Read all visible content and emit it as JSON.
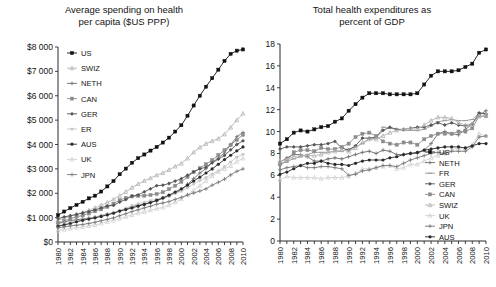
{
  "chart_data": [
    {
      "id": "left",
      "type": "line",
      "title": "Average spending on health per capita ($US PPP)",
      "title_lines": [
        "Average spending on health",
        "per capita ($US PPP)"
      ],
      "xlabel": "",
      "ylabel": "",
      "ylim": [
        0,
        8000
      ],
      "ytick_values": [
        0,
        1000,
        2000,
        3000,
        4000,
        5000,
        6000,
        7000,
        8000
      ],
      "ytick_labels": [
        "$0",
        "$1 000",
        "$2 000",
        "$3 000",
        "$4 000",
        "$5 000",
        "$6 000",
        "$7 000",
        "$8 000"
      ],
      "xlim": [
        1980,
        2010
      ],
      "xtick_values": [
        1980,
        1982,
        1984,
        1986,
        1988,
        1990,
        1992,
        1994,
        1996,
        1998,
        2000,
        2002,
        2004,
        2006,
        2008,
        2010
      ],
      "xtick_labels": [
        "1980",
        "1982",
        "1984",
        "1986",
        "1988",
        "1990",
        "1992",
        "1994",
        "1996",
        "1998",
        "2000",
        "2002",
        "2004",
        "2006",
        "2008",
        "2010"
      ],
      "x": [
        1980,
        1981,
        1982,
        1983,
        1984,
        1985,
        1986,
        1987,
        1988,
        1989,
        1990,
        1991,
        1992,
        1993,
        1994,
        1995,
        1996,
        1997,
        1998,
        1999,
        2000,
        2001,
        2002,
        2003,
        2004,
        2005,
        2006,
        2007,
        2008,
        2009,
        2010
      ],
      "grid": false,
      "legend_position": "upper-left",
      "series": [
        {
          "name": "US",
          "color": "#111111",
          "marker": "square",
          "values": [
            1100,
            1250,
            1390,
            1520,
            1650,
            1790,
            1900,
            2070,
            2280,
            2500,
            2780,
            3010,
            3250,
            3440,
            3590,
            3750,
            3900,
            4080,
            4280,
            4530,
            4790,
            5180,
            5600,
            6000,
            6370,
            6720,
            7070,
            7430,
            7720,
            7850,
            7900
          ]
        },
        {
          "name": "SWIZ",
          "color": "#b4b4b4",
          "marker": "triangle",
          "values": [
            900,
            980,
            1060,
            1140,
            1210,
            1300,
            1400,
            1510,
            1620,
            1750,
            1900,
            2060,
            2230,
            2380,
            2510,
            2620,
            2740,
            2830,
            2960,
            3100,
            3220,
            3430,
            3680,
            3880,
            4030,
            4140,
            4240,
            4420,
            4700,
            5000,
            5270
          ]
        },
        {
          "name": "NETH",
          "color": "#6e6e6e",
          "marker": "plus",
          "values": [
            760,
            820,
            880,
            910,
            940,
            980,
            1020,
            1080,
            1150,
            1200,
            1270,
            1350,
            1450,
            1510,
            1560,
            1620,
            1690,
            1790,
            1890,
            2010,
            2130,
            2370,
            2600,
            2830,
            3010,
            3270,
            3450,
            3660,
            3990,
            4320,
            4490
          ]
        },
        {
          "name": "CAN",
          "color": "#8c8c8c",
          "marker": "square",
          "values": [
            780,
            860,
            960,
            1030,
            1090,
            1170,
            1260,
            1340,
            1440,
            1570,
            1720,
            1810,
            1870,
            1890,
            1900,
            1930,
            1970,
            2040,
            2170,
            2310,
            2470,
            2670,
            2870,
            3030,
            3190,
            3360,
            3570,
            3770,
            3980,
            4190,
            4400
          ]
        },
        {
          "name": "GER",
          "color": "#555555",
          "marker": "diamond",
          "values": [
            960,
            1030,
            1080,
            1130,
            1190,
            1250,
            1320,
            1400,
            1480,
            1500,
            1640,
            1740,
            1890,
            1930,
            2060,
            2180,
            2310,
            2330,
            2400,
            2500,
            2600,
            2740,
            2880,
            3000,
            3070,
            3250,
            3400,
            3550,
            3780,
            4000,
            4150
          ]
        },
        {
          "name": "ER",
          "color": "#c8c8c8",
          "marker": "circle",
          "values": [
            660,
            730,
            800,
            860,
            910,
            960,
            1010,
            1080,
            1150,
            1220,
            1300,
            1390,
            1490,
            1570,
            1630,
            1700,
            1760,
            1820,
            1890,
            1990,
            2090,
            2230,
            2380,
            2520,
            2640,
            2790,
            2920,
            3090,
            3280,
            3480,
            3600
          ]
        },
        {
          "name": "AUS",
          "color": "#2b2b2b",
          "marker": "circle",
          "values": [
            650,
            700,
            760,
            830,
            890,
            940,
            990,
            1050,
            1110,
            1180,
            1270,
            1330,
            1400,
            1470,
            1540,
            1620,
            1710,
            1810,
            1920,
            2050,
            2180,
            2330,
            2500,
            2660,
            2830,
            3000,
            3190,
            3380,
            3560,
            3740,
            3900
          ]
        },
        {
          "name": "UK",
          "color": "#d2d2d2",
          "marker": "triangle",
          "values": [
            470,
            510,
            550,
            590,
            620,
            660,
            700,
            760,
            830,
            890,
            960,
            1030,
            1110,
            1180,
            1240,
            1300,
            1370,
            1420,
            1510,
            1630,
            1760,
            1940,
            2120,
            2310,
            2510,
            2710,
            2880,
            3000,
            3120,
            3300,
            3430
          ]
        },
        {
          "name": "JPN",
          "color": "#787878",
          "marker": "plus",
          "values": [
            580,
            620,
            660,
            690,
            720,
            760,
            810,
            870,
            930,
            990,
            1080,
            1160,
            1250,
            1320,
            1400,
            1470,
            1550,
            1600,
            1660,
            1750,
            1830,
            1930,
            2010,
            2090,
            2180,
            2330,
            2450,
            2580,
            2750,
            2900,
            3000
          ]
        }
      ]
    },
    {
      "id": "right",
      "type": "line",
      "title": "Total health expenditures as percent of GDP",
      "title_lines": [
        "Total health expenditures as",
        "percent of GDP"
      ],
      "xlabel": "",
      "ylabel": "",
      "ylim": [
        0,
        18
      ],
      "ytick_values": [
        0,
        2,
        4,
        6,
        8,
        10,
        12,
        14,
        16,
        18
      ],
      "ytick_labels": [
        "0",
        "2",
        "4",
        "6",
        "8",
        "10",
        "12",
        "14",
        "16",
        "18"
      ],
      "xlim": [
        1980,
        2010
      ],
      "xtick_values": [
        1980,
        1982,
        1984,
        1986,
        1988,
        1990,
        1992,
        1994,
        1996,
        1998,
        2000,
        2002,
        2004,
        2006,
        2008,
        2010
      ],
      "xtick_labels": [
        "1980",
        "1982",
        "1984",
        "1986",
        "1988",
        "1990",
        "1992",
        "1994",
        "1996",
        "1998",
        "2000",
        "2002",
        "2004",
        "2006",
        "2008",
        "2010"
      ],
      "x": [
        1980,
        1981,
        1982,
        1983,
        1984,
        1985,
        1986,
        1987,
        1988,
        1989,
        1990,
        1991,
        1992,
        1993,
        1994,
        1995,
        1996,
        1997,
        1998,
        1999,
        2000,
        2001,
        2002,
        2003,
        2004,
        2005,
        2006,
        2007,
        2008,
        2009,
        2010
      ],
      "grid": false,
      "legend_position": "lower-right",
      "series": [
        {
          "name": "US",
          "color": "#111111",
          "marker": "square",
          "values": [
            8.9,
            9.3,
            9.9,
            10.1,
            10.0,
            10.2,
            10.4,
            10.5,
            10.9,
            11.2,
            11.9,
            12.5,
            13.1,
            13.5,
            13.5,
            13.5,
            13.4,
            13.4,
            13.4,
            13.4,
            13.5,
            14.3,
            15.1,
            15.5,
            15.5,
            15.5,
            15.6,
            15.9,
            16.2,
            17.2,
            17.5
          ]
        },
        {
          "name": "NETH",
          "color": "#6e6e6e",
          "marker": "plus",
          "values": [
            7.2,
            7.6,
            7.9,
            7.9,
            7.7,
            7.3,
            7.3,
            7.5,
            7.6,
            7.5,
            7.7,
            7.9,
            8.1,
            8.2,
            8.0,
            8.3,
            8.2,
            7.9,
            7.9,
            8.0,
            8.0,
            8.3,
            8.9,
            9.8,
            10.0,
            9.8,
            9.7,
            10.2,
            10.7,
            11.5,
            11.9
          ]
        },
        {
          "name": "FR",
          "color": "#9a9a9a",
          "marker": "dash",
          "values": [
            7.0,
            7.3,
            7.5,
            7.7,
            7.9,
            8.1,
            8.1,
            8.1,
            8.2,
            8.2,
            8.4,
            8.6,
            8.9,
            9.3,
            9.4,
            10.4,
            10.3,
            10.2,
            10.1,
            10.1,
            10.1,
            10.2,
            10.5,
            10.9,
            11.0,
            11.1,
            11.0,
            11.0,
            11.1,
            11.7,
            11.6
          ]
        },
        {
          "name": "GER",
          "color": "#555555",
          "marker": "diamond",
          "values": [
            8.4,
            8.6,
            8.6,
            8.6,
            8.7,
            8.8,
            8.8,
            8.9,
            9.1,
            8.5,
            8.3,
            8.7,
            9.4,
            9.4,
            9.5,
            10.1,
            10.4,
            10.2,
            10.2,
            10.3,
            10.4,
            10.4,
            10.6,
            10.8,
            10.6,
            10.8,
            10.6,
            10.5,
            10.7,
            11.7,
            11.6
          ]
        },
        {
          "name": "CAN",
          "color": "#8c8c8c",
          "marker": "square",
          "values": [
            7.0,
            7.3,
            8.1,
            8.3,
            8.3,
            8.2,
            8.5,
            8.4,
            8.4,
            8.6,
            8.9,
            9.5,
            9.8,
            9.9,
            9.6,
            9.1,
            8.9,
            8.8,
            9.0,
            9.0,
            8.8,
            9.3,
            9.6,
            9.8,
            9.8,
            9.8,
            10.0,
            10.0,
            10.3,
            11.4,
            11.4
          ]
        },
        {
          "name": "SWIZ",
          "color": "#b4b4b4",
          "marker": "triangle",
          "values": [
            7.3,
            7.4,
            7.7,
            7.8,
            7.8,
            7.8,
            7.9,
            8.1,
            8.2,
            8.3,
            8.2,
            8.5,
            9.0,
            9.3,
            9.3,
            9.6,
            9.9,
            10.1,
            10.2,
            10.3,
            10.2,
            10.6,
            11.0,
            11.3,
            11.3,
            11.2,
            10.8,
            10.6,
            10.7,
            11.4,
            11.5
          ]
        },
        {
          "name": "UK",
          "color": "#d2d2d2",
          "marker": "triangle",
          "values": [
            5.6,
            5.9,
            5.8,
            5.8,
            5.8,
            5.8,
            5.7,
            5.8,
            5.8,
            5.8,
            5.9,
            6.2,
            6.6,
            6.6,
            6.7,
            6.8,
            6.9,
            6.6,
            6.7,
            7.0,
            7.0,
            7.3,
            7.6,
            7.8,
            8.1,
            8.3,
            8.5,
            8.5,
            8.8,
            9.8,
            9.6
          ]
        },
        {
          "name": "JPN",
          "color": "#787878",
          "marker": "plus",
          "values": [
            6.5,
            6.7,
            6.8,
            6.9,
            6.7,
            6.7,
            6.8,
            6.8,
            6.7,
            6.6,
            6.0,
            6.1,
            6.4,
            6.5,
            6.7,
            6.9,
            6.9,
            6.8,
            7.1,
            7.4,
            7.6,
            7.8,
            8.0,
            8.1,
            8.0,
            8.2,
            8.2,
            8.2,
            8.6,
            9.5,
            9.6
          ]
        },
        {
          "name": "AUS",
          "color": "#2b2b2b",
          "marker": "circle",
          "values": [
            6.1,
            6.3,
            6.6,
            6.9,
            7.1,
            7.1,
            7.3,
            7.1,
            7.0,
            7.0,
            6.9,
            7.1,
            7.3,
            7.4,
            7.4,
            7.4,
            7.6,
            7.7,
            7.9,
            8.0,
            8.1,
            8.3,
            8.4,
            8.5,
            8.6,
            8.6,
            8.6,
            8.5,
            8.7,
            8.9,
            8.9
          ]
        }
      ]
    }
  ]
}
